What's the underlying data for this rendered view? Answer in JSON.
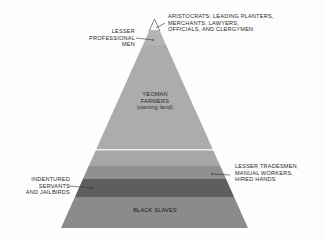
{
  "diagram": {
    "type": "social-class-pyramid",
    "layers": [
      {
        "id": "aristocrats",
        "label_lines": [
          "ARISTOCRATS: LEADING PLANTERS,",
          "MERCHANTS, LAWYERS,",
          "OFFICIALS, AND CLERGYMEN"
        ],
        "color": "#f6f6f6"
      },
      {
        "id": "lesser-professional",
        "label_lines": [
          "LESSER",
          "PROFESSIONAL",
          "MEN"
        ],
        "color": "#b4b4b4"
      },
      {
        "id": "yeoman-farmers",
        "label_lines": [
          "YEOMAN",
          "FARMERS",
          "(owning land)"
        ],
        "color": "#ababab"
      },
      {
        "id": "lesser-tradesmen",
        "label_lines": [
          "LESSER TRADESMEN,",
          "MANUAL WORKERS,",
          "HIRED HANDS"
        ],
        "color_upper": "#a6a6a6",
        "color_lower": "#8e8e8e"
      },
      {
        "id": "indentured-servants",
        "label_lines": [
          "INDENTURED",
          "SERVANTS",
          "AND JAILBIRDS"
        ],
        "color": "#5d5d5d"
      },
      {
        "id": "black-slaves",
        "label_lines": [
          "BLACK SLAVES"
        ],
        "color": "#8a8a8a"
      }
    ],
    "separator_color": "#e8e8e8",
    "outline_color": "#555555",
    "text_color": "#2a2a2a"
  }
}
